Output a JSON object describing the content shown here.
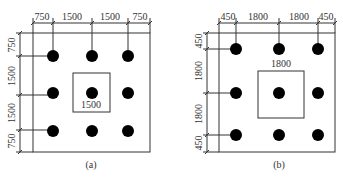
{
  "panels": [
    {
      "caption": "(a)",
      "top_dims": [
        "750",
        "1500",
        "1500",
        "750"
      ],
      "left_dims": [
        "750",
        "1500",
        "1500",
        "750"
      ],
      "center_label": "1500"
    },
    {
      "caption": "(b)",
      "top_dims": [
        "450",
        "1800",
        "1800",
        "450"
      ],
      "left_dims": [
        "450",
        "1800",
        "1800",
        "450"
      ],
      "center_label": "1800"
    }
  ],
  "colors": {
    "line": "#333333",
    "pile": "#000000",
    "background": "#ffffff"
  }
}
